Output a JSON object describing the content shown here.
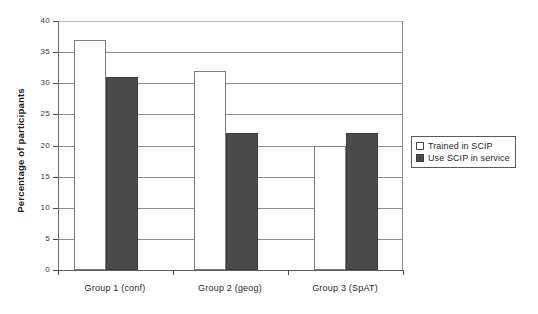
{
  "chart_data": {
    "type": "bar",
    "title": "",
    "xlabel": "",
    "ylabel": "Percentage of participants",
    "categories": [
      "Group 1 (conf)",
      "Group 2 (geog)",
      "Group 3 (SpAT)"
    ],
    "series": [
      {
        "name": "Trained in SCIP",
        "values": [
          37,
          32,
          20
        ],
        "color": "#ffffff"
      },
      {
        "name": "Use SCIP in service",
        "values": [
          31,
          22,
          22
        ],
        "color": "#4b4b4b"
      }
    ],
    "ylim": [
      0,
      40
    ],
    "yticks": [
      0,
      5,
      10,
      15,
      20,
      25,
      30,
      35,
      40
    ],
    "ytick_labels": [
      "0",
      "5",
      "10",
      "15",
      "20",
      "25",
      "30",
      "35",
      "40"
    ],
    "grid": true,
    "legend_position": "right-middle"
  },
  "axes": {
    "y_title": "Percentage of participants"
  },
  "legend": {
    "entries": [
      {
        "label": "Trained in SCIP",
        "swatch": "hollow-square-icon"
      },
      {
        "label": "Use SCIP in service",
        "swatch": "filled-square-icon"
      }
    ]
  },
  "colors": {
    "bar_trained": "#ffffff",
    "bar_inservice": "#4b4b4b",
    "gridline": "#8f8f8f",
    "axis": "#5a5a5a",
    "text": "#1f1f1f",
    "background": "#ffffff"
  }
}
